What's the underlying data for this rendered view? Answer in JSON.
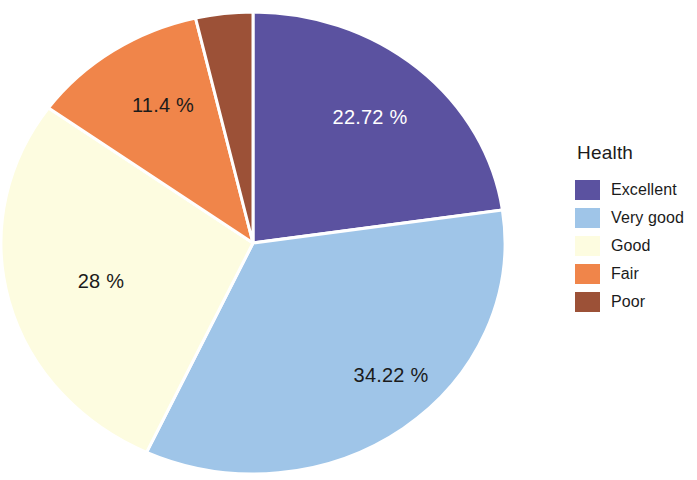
{
  "chart_data": {
    "type": "pie",
    "title": "Health",
    "categories": [
      "Excellent",
      "Very good",
      "Good",
      "Fair",
      "Poor"
    ],
    "values": [
      22.72,
      34.22,
      28,
      11.4,
      3.66
    ],
    "value_labels": [
      "22.72 %",
      "34.22 %",
      "28 %",
      "11.4 %",
      ""
    ],
    "colors": [
      "#5b52a0",
      "#9fc5e8",
      "#fdfce0",
      "#f0854a",
      "#9c5137"
    ],
    "label_colors": [
      "#ffffff",
      "#1b1b1b",
      "#1b1b1b",
      "#1b1b1b",
      "#1b1b1b"
    ],
    "unit": "%",
    "start_angle_deg": 0,
    "direction": "clockwise",
    "grid": false,
    "legend_position": "right",
    "xlabel": "",
    "ylabel": ""
  },
  "legend": {
    "title": "Health",
    "items": [
      {
        "label": "Excellent",
        "color": "#5b52a0"
      },
      {
        "label": "Very good",
        "color": "#9fc5e8"
      },
      {
        "label": "Good",
        "color": "#fdfce0"
      },
      {
        "label": "Fair",
        "color": "#f0854a"
      },
      {
        "label": "Poor",
        "color": "#9c5137"
      }
    ]
  },
  "pie_labels": [
    {
      "text": "22.72 %",
      "x": 370,
      "y": 124,
      "tone": "light"
    },
    {
      "text": "34.22 %",
      "x": 391,
      "y": 382,
      "tone": "dark"
    },
    {
      "text": "28 %",
      "x": 101,
      "y": 288,
      "tone": "dark"
    },
    {
      "text": "11.4 %",
      "x": 163,
      "y": 112,
      "tone": "dark"
    }
  ]
}
